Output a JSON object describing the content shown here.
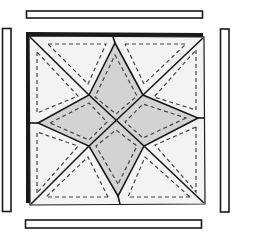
{
  "diagram": {
    "type": "quilt-block-assembly",
    "colors": {
      "outline": "#1a1a1a",
      "star_fill": "#d3d3d3",
      "background_fill": "#f3f3f3",
      "strip_fill": "#ffffff",
      "stitch_line": "#444444"
    },
    "block": {
      "corners": {
        "tl": [
          27,
          33
        ],
        "tr": [
          204,
          36
        ],
        "br": [
          204,
          204
        ],
        "bl": [
          28,
          204
        ]
      },
      "edge_midpoints": {
        "top": [
          115,
          35
        ],
        "right": [
          204,
          118
        ],
        "bottom": [
          119,
          204
        ],
        "left": [
          29,
          123
        ]
      },
      "center": [
        116,
        122
      ],
      "inner_vertices": {
        "ul": [
          89,
          95
        ],
        "ur": [
          143,
          95
        ],
        "lr": [
          144,
          146
        ],
        "ll": [
          89,
          146
        ]
      },
      "star_tips": {
        "top": [
          115,
          43
        ],
        "right": [
          198,
          118
        ],
        "bottom": [
          118,
          196
        ],
        "left": [
          38,
          123
        ]
      }
    },
    "strips": [
      {
        "name": "top-strip",
        "x": 26,
        "y": 11,
        "w": 177,
        "h": 7
      },
      {
        "name": "bottom-strip",
        "x": 25,
        "y": 220,
        "w": 177,
        "h": 8
      },
      {
        "name": "left-strip",
        "x": 2,
        "y": 28,
        "w": 9,
        "h": 184
      },
      {
        "name": "right-strip",
        "x": 220,
        "y": 29,
        "w": 9,
        "h": 183
      }
    ]
  }
}
